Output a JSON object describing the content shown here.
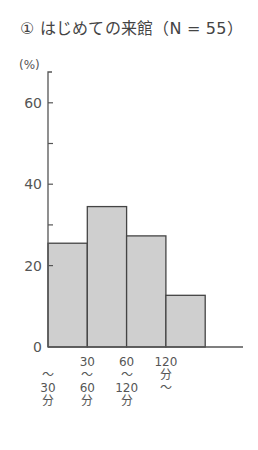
{
  "chart_data": {
    "type": "bar",
    "title": "① はじめての来館（N = 55）",
    "xlabel": "",
    "ylabel": "(%)",
    "ylim": [
      0,
      70
    ],
    "yticks": [
      0,
      20,
      40,
      60
    ],
    "minor_yticks": [
      30,
      50
    ],
    "grid": false,
    "legend": null,
    "categories": [
      "～30分",
      "30～60分",
      "60～120分",
      "120分～"
    ],
    "category_labels": [
      [
        "",
        "～",
        "30",
        "分"
      ],
      [
        "30",
        "～",
        "60",
        "分"
      ],
      [
        "60",
        "～",
        "120",
        "分"
      ],
      [
        "120",
        "分",
        "～",
        ""
      ]
    ],
    "values": [
      25.5,
      34.5,
      27.3,
      12.7
    ],
    "bar_color": "#cfcfcf",
    "edge_color": "#444444"
  },
  "header": {
    "title": "① はじめての来館（N = 55）",
    "unit": "(%)"
  }
}
